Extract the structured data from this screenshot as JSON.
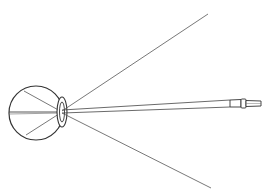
{
  "diagram": {
    "colors": {
      "background": "#ffffff",
      "stroke": "#333333",
      "ray": "#555555"
    },
    "eye": {
      "cx": 36,
      "cy": 113,
      "r": 27
    },
    "lens": {
      "cx": 62,
      "cy": 112,
      "rx": 5,
      "ry": 15
    },
    "pencil": {
      "x1": 62,
      "y1": 111,
      "x2": 262,
      "y2": 104
    },
    "rays": [
      {
        "x1": 36,
        "y1": 112,
        "x2": 208,
        "y2": 14
      },
      {
        "x1": 36,
        "y1": 112,
        "x2": 211,
        "y2": 188
      }
    ]
  }
}
